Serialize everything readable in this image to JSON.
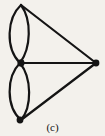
{
  "figure": {
    "caption": "(c)",
    "background_color": "#f3f1ec",
    "ink_color": "#141414",
    "type": "multigraph-diagram",
    "vertices": [
      {
        "id": "top",
        "label": "",
        "x": 21,
        "y": 5,
        "radius": 3.4
      },
      {
        "id": "middle",
        "label": "",
        "x": 20,
        "y": 63,
        "radius": 3.4
      },
      {
        "id": "bottom",
        "label": "",
        "x": 21,
        "y": 120,
        "radius": 3.4
      },
      {
        "id": "right",
        "label": "",
        "x": 96,
        "y": 63,
        "radius": 3.4
      }
    ],
    "edges": [
      {
        "id": "e1",
        "from": "top",
        "to": "middle",
        "kind": "curve",
        "side": "left",
        "path": "M 21 5 C 7 18, 5 48, 20 63"
      },
      {
        "id": "e2",
        "from": "top",
        "to": "middle",
        "kind": "curve",
        "side": "right",
        "path": "M 21 5 C 32 20, 31 48, 20 63"
      },
      {
        "id": "e3",
        "from": "middle",
        "to": "bottom",
        "kind": "curve",
        "side": "left",
        "path": "M 20 63 C 6 77, 6 107, 21 120"
      },
      {
        "id": "e4",
        "from": "middle",
        "to": "bottom",
        "kind": "curve",
        "side": "right",
        "path": "M 20 63 C 32 78, 32 107, 21 120"
      },
      {
        "id": "e5",
        "from": "top",
        "to": "right",
        "kind": "line",
        "path": "M 21 5 L 96 63"
      },
      {
        "id": "e6",
        "from": "middle",
        "to": "right",
        "kind": "line",
        "path": "M 20 63 L 96 63"
      },
      {
        "id": "e7",
        "from": "bottom",
        "to": "right",
        "kind": "line",
        "path": "M 21 120 L 96 63"
      }
    ],
    "stroke_width": 2.2,
    "canvas": {
      "width": 105,
      "height": 136
    }
  }
}
